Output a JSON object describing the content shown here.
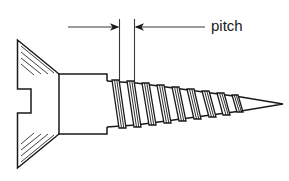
{
  "diagram": {
    "orientation": "head at left, point at right",
    "background_color": "#ffffff",
    "line_color": "#1a1a1a"
  },
  "annotations": {
    "pitch_label": "pitch",
    "dimension": {
      "name": "pitch",
      "left_extension_x": 119,
      "right_extension_x": 134,
      "arrow_y": 27,
      "leader_end_x": 205,
      "describes": "axial distance between two adjacent thread crests"
    }
  },
  "geometry": {
    "head": {
      "type": "countersunk-flat-head",
      "left_face_x": 17,
      "top_y": 40,
      "bottom_y": 168,
      "cone_end_x": 59,
      "slot": {
        "name": "drive-slot",
        "notch_x": 17,
        "notch_depth": 14,
        "top_y": 89,
        "bottom_y": 113
      },
      "hatch_line_count_upper": 4,
      "hatch_line_count_lower": 4
    },
    "shank": {
      "start_x": 59,
      "end_x": 107,
      "top_y": 74,
      "bottom_y": 134,
      "step_x": 107,
      "step_top_y": 80,
      "step_bottom_y": 128
    },
    "threads": {
      "count": 9,
      "start_x": 112,
      "end_x": 245,
      "lean": "leaning-right",
      "crest_spacing": 15,
      "root_top_y": 82,
      "root_bottom_y": 126
    },
    "point": {
      "type": "gimlet-point",
      "tip_x": 283,
      "tip_y": 104,
      "base_x": 245
    }
  }
}
